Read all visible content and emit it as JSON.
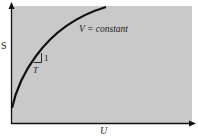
{
  "diagram": {
    "type": "entropy-energy curve",
    "y_axis_label": "S",
    "x_axis_label": "U",
    "curve_label": "V =  constant",
    "slope_run_label": "T",
    "slope_rise_label": "1",
    "colors": {
      "plot_background": "#c9c9c9",
      "curve": "#111111",
      "axis": "#111111"
    }
  }
}
